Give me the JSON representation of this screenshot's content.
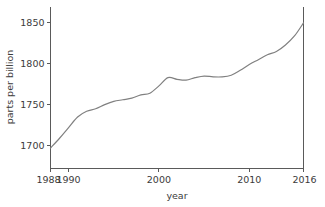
{
  "chart_data": {
    "type": "line",
    "title": "",
    "xlabel": "year",
    "ylabel": "parts per billion",
    "xlim": [
      1988,
      2016
    ],
    "ylim": [
      1672,
      1870
    ],
    "grid": false,
    "legend": null,
    "line_color": "#808080",
    "axis_color": "#5a5a5a",
    "text_color": "#3b3b3b",
    "background": "#ffffff",
    "xticks": [
      1988,
      1990,
      2000,
      2010,
      2016
    ],
    "xtick_labels": [
      "1988",
      "1990",
      "2000",
      "2010",
      "2016"
    ],
    "yticks": [
      1700,
      1750,
      1800,
      1850
    ],
    "ytick_labels": [
      "1700",
      "1750",
      "1800",
      "1850"
    ],
    "x": [
      1988,
      1989,
      1990,
      1991,
      1992,
      1993,
      1994,
      1995,
      1996,
      1997,
      1998,
      1999,
      2000,
      2001,
      2002,
      2003,
      2004,
      2005,
      2006,
      2007,
      2008,
      2009,
      2010,
      2011,
      2012,
      2013,
      2014,
      2015,
      2016
    ],
    "values": [
      1697,
      1709,
      1722,
      1735,
      1742,
      1745,
      1750,
      1754,
      1756,
      1758,
      1762,
      1764,
      1773,
      1783,
      1781,
      1780,
      1783,
      1785,
      1784,
      1784,
      1786,
      1792,
      1799,
      1805,
      1811,
      1815,
      1823,
      1834,
      1850
    ],
    "series": [
      {
        "name": "methane",
        "values": [
          1697,
          1709,
          1722,
          1735,
          1742,
          1745,
          1750,
          1754,
          1756,
          1758,
          1762,
          1764,
          1773,
          1783,
          1781,
          1780,
          1783,
          1785,
          1784,
          1784,
          1786,
          1792,
          1799,
          1805,
          1811,
          1815,
          1823,
          1834,
          1850
        ]
      }
    ]
  }
}
